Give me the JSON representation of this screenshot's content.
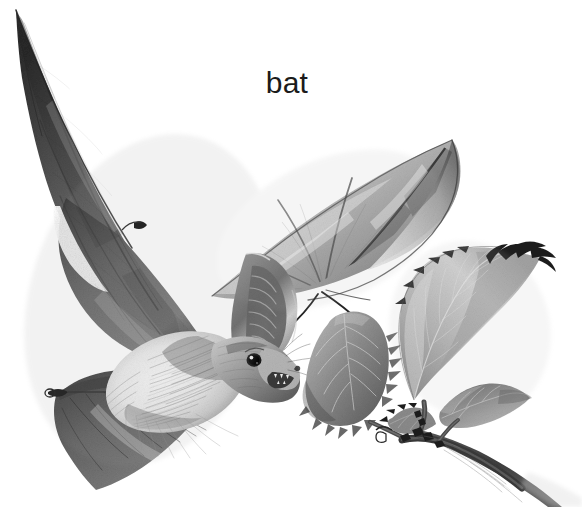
{
  "illustration": {
    "subject_label": "bat",
    "medium": "graphite pencil drawing",
    "palette": "grayscale",
    "background_color": "#ffffff",
    "ink_darkest": "#1b1b1b",
    "ink_mid": "#6b6b6b",
    "ink_light": "#bdbdbd",
    "ink_pale": "#e2e2e2",
    "width": 582,
    "height": 507,
    "elements": [
      {
        "name": "bat-left-wing",
        "description": "large dark outstretched left wing membrane with long pointed tip reaching the upper-left corner",
        "tone": "#5e5e5e"
      },
      {
        "name": "bat-right-wing",
        "description": "pale upper-right wing membrane with radiating finger bones",
        "tone": "#b4b4b4"
      },
      {
        "name": "bat-body",
        "description": "fluffy light fur body and chest",
        "tone": "#f0f0f0"
      },
      {
        "name": "bat-head",
        "description": "head with dark eye, pointed ear and open snout",
        "tone": "#8a8a8a"
      },
      {
        "name": "bat-ear",
        "description": "large pointed ear with internal ridges",
        "tone": "#6f6f6f"
      },
      {
        "name": "bat-lower-wing",
        "description": "lower-left wing with visible thumb claw and membrane striations",
        "tone": "#6a6a6a"
      },
      {
        "name": "plant-leaf-serrated",
        "description": "toothed serrated leaf at center-right",
        "tone": "#9a9a9a"
      },
      {
        "name": "plant-leaf-large",
        "description": "large upright leaf with pale veins and dark serrated tip",
        "tone": "#c0c0c0"
      },
      {
        "name": "plant-leaf-small",
        "description": "small side leaf sprouting from the stem",
        "tone": "#a8a8a8"
      },
      {
        "name": "plant-stem",
        "description": "woody branch with nodes running to the lower-right corner",
        "tone": "#4f4f4f"
      }
    ]
  }
}
